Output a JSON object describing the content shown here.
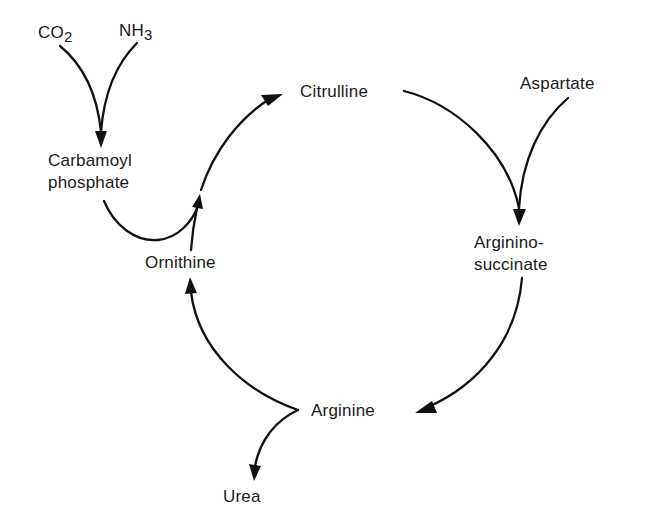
{
  "diagram": {
    "type": "metabolic-cycle",
    "nodes": {
      "co2": {
        "main": "CO",
        "sub": "2"
      },
      "nh3": {
        "main": "NH",
        "sub": "3"
      },
      "carbamoyl_phosphate": {
        "line1": "Carbamoyl",
        "line2": "phosphate"
      },
      "citrulline": {
        "label": "Citrulline"
      },
      "aspartate": {
        "label": "Aspartate"
      },
      "argininosuccinate": {
        "line1": "Arginino-",
        "line2": "succinate"
      },
      "arginine": {
        "label": "Arginine"
      },
      "ornithine": {
        "label": "Ornithine"
      },
      "urea": {
        "label": "Urea"
      }
    },
    "edges": [
      {
        "from": "CO2",
        "to": "Carbamoyl phosphate",
        "merge_with": "NH3"
      },
      {
        "from": "NH3",
        "to": "Carbamoyl phosphate",
        "merge_with": "CO2"
      },
      {
        "from": "Carbamoyl phosphate",
        "to": "Citrulline",
        "merge_with": "Ornithine"
      },
      {
        "from": "Ornithine",
        "to": "Citrulline",
        "merge_with": "Carbamoyl phosphate"
      },
      {
        "from": "Citrulline",
        "to": "Argininosuccinate",
        "merge_with": "Aspartate"
      },
      {
        "from": "Aspartate",
        "to": "Argininosuccinate",
        "merge_with": "Citrulline"
      },
      {
        "from": "Argininosuccinate",
        "to": "Arginine"
      },
      {
        "from": "Arginine",
        "to": "Ornithine",
        "split_with": "Urea"
      },
      {
        "from": "Arginine",
        "to": "Urea",
        "split_with": "Ornithine"
      }
    ],
    "colors": {
      "stroke": "#111111",
      "text": "#1a1a1a",
      "background": "#ffffff"
    }
  }
}
